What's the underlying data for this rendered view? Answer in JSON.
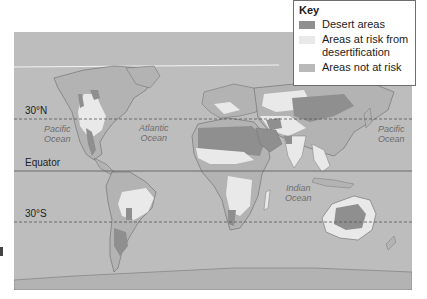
{
  "key": {
    "title": "Key",
    "items": [
      {
        "label": "Desert areas",
        "color": "#8f8f8f"
      },
      {
        "label": "Areas at risk from desertification",
        "label_line1": "Areas at risk from",
        "label_line2": "desertification",
        "color": "#e9e9e9"
      },
      {
        "label": "Areas not at risk",
        "color": "#b9b9b9"
      }
    ]
  },
  "latitudes": {
    "north": "30°N",
    "equator": "Equator",
    "south": "30°S"
  },
  "oceans": {
    "pacific_west": {
      "line1": "Pacific",
      "line2": "Ocean"
    },
    "atlantic": {
      "line1": "Atlantic",
      "line2": "Ocean"
    },
    "pacific_east": {
      "line1": "Pacific",
      "line2": "Ocean"
    },
    "indian": {
      "line1": "Indian",
      "line2": "Ocean"
    }
  },
  "colors": {
    "ocean": "#bdbdbd",
    "land_not_at_risk": "#b3b3b3",
    "desert": "#8f8f8f",
    "at_risk": "#e9e9e9",
    "coastline": "#6a6a6a"
  }
}
